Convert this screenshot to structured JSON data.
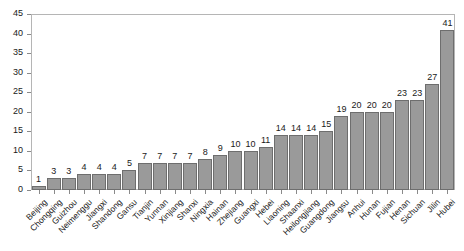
{
  "chart_data": {
    "type": "bar",
    "title": "",
    "subtitle": "",
    "xlabel": "",
    "ylabel": "",
    "ylim": [
      0,
      45
    ],
    "ytick_step": 5,
    "yticks": [
      0,
      5,
      10,
      15,
      20,
      25,
      30,
      35,
      40,
      45
    ],
    "grid": false,
    "legend": false,
    "legend_position": "none",
    "show_value_labels": true,
    "xtick_label_rotation": -45,
    "categories": [
      "Beijing",
      "Chongqing",
      "Guizhou",
      "Neimenggu",
      "Jiangxi",
      "Shandong",
      "Gansu",
      "Tianjin",
      "Yunnan",
      "Xinjiang",
      "Shanxi",
      "Ningxia",
      "Hainan",
      "Zhejiang",
      "Guangxi",
      "Hebei",
      "Liaoning",
      "Shaanxi",
      "Heilongjiang",
      "Guangdong",
      "Jiangsu",
      "Anhui",
      "Hunan",
      "Fujian",
      "Henan",
      "Sichuan",
      "Jilin",
      "Hubei"
    ],
    "values": [
      1,
      3,
      3,
      4,
      4,
      4,
      5,
      7,
      7,
      7,
      7,
      8,
      9,
      10,
      10,
      11,
      14,
      14,
      14,
      15,
      19,
      20,
      20,
      20,
      23,
      23,
      27,
      41
    ],
    "colors": {
      "bar_fill": "#9a9a9a",
      "bar_stroke": "#6e6e6e",
      "axis": "#8a8a8a",
      "frame": "#b5b5b5",
      "text": "#1a1a1a",
      "background": "#ffffff"
    }
  }
}
